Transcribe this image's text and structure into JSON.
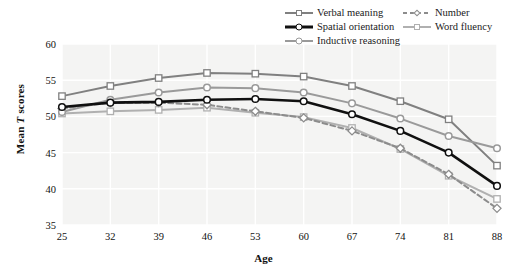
{
  "chart_data": {
    "type": "line",
    "title": "",
    "xlabel": "Age",
    "ylabel": "Mean T scores",
    "categories": [
      25,
      32,
      39,
      46,
      53,
      60,
      67,
      74,
      81,
      88
    ],
    "xlim": [
      25,
      88
    ],
    "ylim": [
      35,
      60
    ],
    "yticks": [
      35,
      40,
      45,
      50,
      55,
      60
    ],
    "xticks": [
      25,
      32,
      39,
      46,
      53,
      60,
      67,
      74,
      81,
      88
    ],
    "grid": true,
    "legend_position": "top-right",
    "series": [
      {
        "name": "Verbal meaning",
        "color": "#808080",
        "marker": "square",
        "dash": "solid",
        "width": 2,
        "values": [
          52.8,
          54.2,
          55.3,
          56.0,
          55.9,
          55.5,
          54.2,
          52.1,
          49.6,
          43.2
        ]
      },
      {
        "name": "Spatial orientation",
        "color": "#101010",
        "marker": "circle",
        "dash": "solid",
        "width": 2.6,
        "values": [
          51.3,
          51.9,
          52.0,
          52.3,
          52.4,
          52.1,
          50.3,
          48.0,
          45.0,
          40.4
        ]
      },
      {
        "name": "Inductive reasoning",
        "color": "#9a9a9a",
        "marker": "circle",
        "dash": "solid",
        "width": 2,
        "values": [
          50.6,
          52.3,
          53.3,
          54.0,
          53.9,
          53.3,
          51.8,
          49.7,
          47.3,
          45.6
        ]
      },
      {
        "name": "Number",
        "color": "#8c8c8c",
        "marker": "diamond",
        "dash": "dashed",
        "width": 2,
        "values": [
          51.1,
          51.9,
          51.9,
          51.6,
          50.7,
          49.8,
          48.0,
          45.6,
          42.0,
          37.3
        ]
      },
      {
        "name": "Word fluency",
        "color": "#b0b0b0",
        "marker": "square",
        "dash": "solid",
        "width": 2,
        "values": [
          50.4,
          50.7,
          50.9,
          51.2,
          50.5,
          49.9,
          48.4,
          45.5,
          41.8,
          38.6
        ]
      }
    ]
  },
  "legend": {
    "columns": [
      {
        "entries": [
          "Verbal meaning",
          "Spatial orientation",
          "Inductive reasoning"
        ]
      },
      {
        "entries": [
          "Number",
          "Word fluency"
        ]
      }
    ]
  },
  "axis": {
    "y_title_pre": "Mean ",
    "y_title_italic": "T",
    "y_title_post": " scores",
    "x_title": "Age"
  },
  "colors": {
    "plot_background": "#f4f4f3",
    "gridline": "#ffffff",
    "text": "#111111"
  }
}
